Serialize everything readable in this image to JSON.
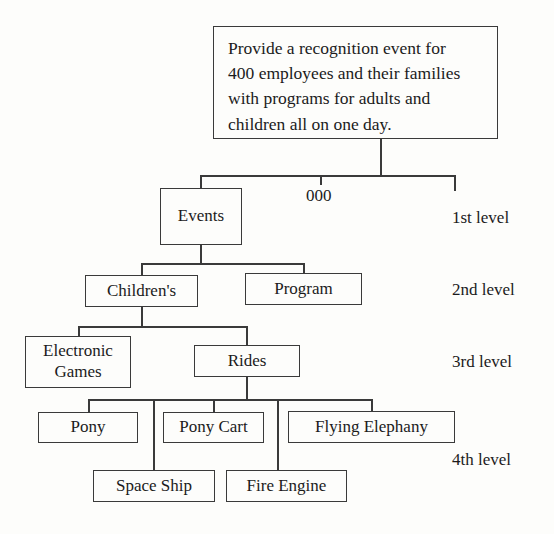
{
  "diagram": {
    "title_box": {
      "lines": [
        "Provide a recognition event for",
        "400 employees and their families",
        "with programs for adults and",
        "children all on one day."
      ],
      "text": "Provide a recognition event for 400 employees and their families with programs for adults and children all on one day."
    },
    "code_label": "000",
    "level_labels": [
      "1st level",
      "2nd level",
      "3rd level",
      "4th level"
    ],
    "nodes": {
      "events": "Events",
      "childrens": "Children's",
      "program": "Program",
      "electronic_games_line1": "Electronic",
      "electronic_games_line2": "Games",
      "electronic_games": "Electronic Games",
      "rides": "Rides",
      "pony": "Pony",
      "pony_cart": "Pony Cart",
      "flying_elephany": "Flying Elephany",
      "space_ship": "Space Ship",
      "fire_engine": "Fire Engine"
    },
    "colors": {
      "stroke": "#3a3a3a",
      "text": "#1b1b1b",
      "background": "#fdfdfb"
    }
  }
}
